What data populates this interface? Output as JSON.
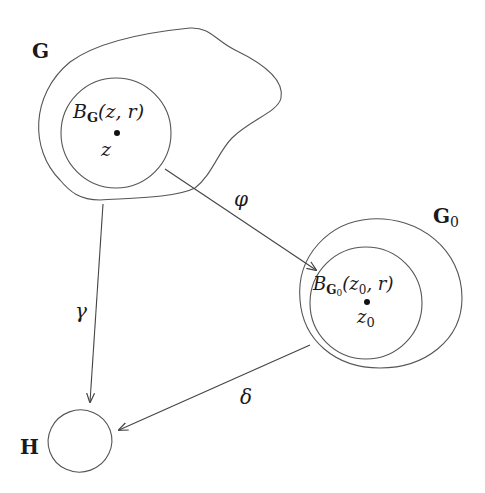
{
  "diagram": {
    "colors": {
      "stroke": "#555555",
      "text": "#1a1a1a",
      "background": "#ffffff"
    },
    "regions": {
      "G": {
        "label": "G"
      },
      "G0": {
        "label": "G",
        "subscript": "0"
      },
      "H": {
        "label": "H"
      }
    },
    "balls": {
      "ball_G": {
        "B": "B",
        "sub": "G",
        "args": "(z, r)",
        "center_label": "z"
      },
      "ball_G0": {
        "B": "B",
        "sub": "G",
        "subsub": "0",
        "args_open": "(z",
        "args_sub": "0",
        "args_close": ", r)",
        "center_label": "z",
        "center_sub": "0"
      }
    },
    "arrows": {
      "phi": {
        "label": "φ",
        "from": "G",
        "to": "G0"
      },
      "gamma": {
        "label": "γ",
        "from": "G",
        "to": "H"
      },
      "delta": {
        "label": "δ",
        "from": "G0",
        "to": "H"
      }
    }
  }
}
